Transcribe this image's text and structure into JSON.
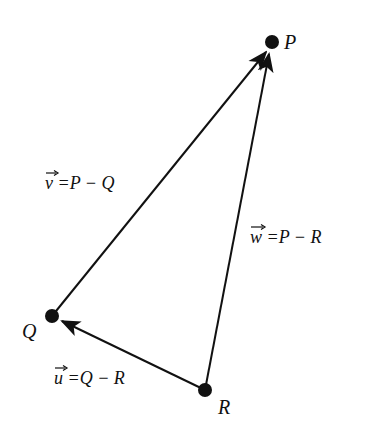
{
  "points": {
    "P": {
      "label": "P",
      "x": 272,
      "y": 42
    },
    "Q": {
      "label": "Q",
      "x": 52,
      "y": 316
    },
    "R": {
      "label": "R",
      "x": 205,
      "y": 390
    }
  },
  "vectors": {
    "v": {
      "name": "v",
      "eq": " =P − Q"
    },
    "w": {
      "name": "w",
      "eq": " =P − R"
    },
    "u": {
      "name": "u",
      "eq": " =Q − R"
    }
  },
  "colors": {
    "ink": "#111111",
    "background": "#ffffff"
  }
}
